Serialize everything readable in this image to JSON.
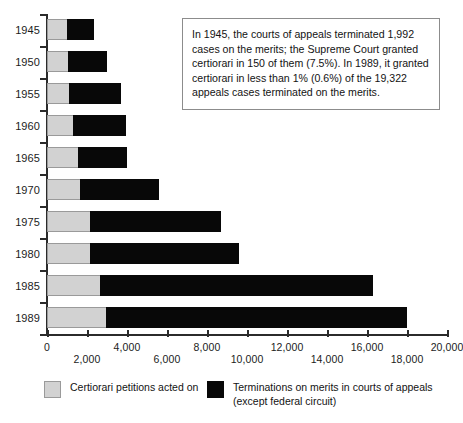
{
  "chart_data": {
    "type": "bar",
    "orientation": "horizontal",
    "stacked": true,
    "title": "",
    "xlabel": "",
    "ylabel": "",
    "xlim": [
      0,
      20000
    ],
    "xticks": [
      0,
      2000,
      4000,
      6000,
      8000,
      10000,
      12000,
      14000,
      16000,
      18000,
      20000
    ],
    "xtick_labels": [
      "0",
      "2,000",
      "4,000",
      "6,000",
      "8,000",
      "10,000",
      "12,000",
      "14,000",
      "16,000",
      "18,000",
      "20,000"
    ],
    "grid": false,
    "legend_position": "bottom",
    "categories": [
      "1945",
      "1950",
      "1955",
      "1960",
      "1965",
      "1970",
      "1975",
      "1980",
      "1985",
      "1989"
    ],
    "series": [
      {
        "name": "Certiorari petitions acted on",
        "color": "#d2d2d2",
        "values": [
          1050,
          1100,
          1150,
          1350,
          1600,
          1700,
          2200,
          2200,
          2700,
          3000
        ]
      },
      {
        "name": "Terminations on merits in courts of appeals (except federal circuit)",
        "color": "#080808",
        "values": [
          1300,
          1900,
          2550,
          2600,
          2400,
          3900,
          6500,
          7400,
          13600,
          15000
        ]
      }
    ],
    "totals": [
      2350,
      3000,
      3700,
      3950,
      4000,
      5600,
      8700,
      9600,
      16300,
      18000
    ],
    "annotations": [
      {
        "text": "In 1945, the courts of appeals terminated 1,992 cases on the merits; the Supreme Court granted certiorari in 150 of them (7.5%). In 1989, it granted certiorari in less than 1% (0.6%) of the 19,322 appeals cases terminated on the merits."
      }
    ]
  },
  "legend": {
    "items": [
      {
        "label": "Certiorari petitions acted on",
        "color": "#d2d2d2"
      },
      {
        "label": "Terminations on merits in courts of appeals\n(except federal circuit)",
        "color": "#080808"
      }
    ]
  },
  "colors": {
    "gray_series": "#d2d2d2",
    "gray_border": "#9a9a9a",
    "black_series": "#080808",
    "axis": "#2b2b2b",
    "annotation_border": "#8c8c8c",
    "background": "#ffffff"
  }
}
